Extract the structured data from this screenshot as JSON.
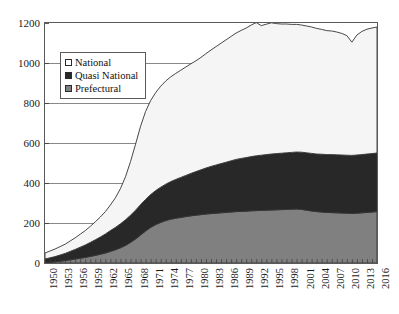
{
  "chart_data": {
    "type": "area",
    "stacked": true,
    "title": "",
    "subtitle": "",
    "xlabel": "",
    "ylabel": "",
    "grid": true,
    "legend_position": "top-left-inside",
    "xlim": [
      1950,
      2016
    ],
    "ylim": [
      0,
      1200
    ],
    "yticks": [
      0,
      200,
      400,
      600,
      800,
      1000,
      1200
    ],
    "xtick_step": 3,
    "xticks": [
      1950,
      1953,
      1956,
      1959,
      1962,
      1965,
      1968,
      1971,
      1974,
      1977,
      1980,
      1983,
      1986,
      1989,
      1992,
      1995,
      1998,
      2001,
      2004,
      2007,
      2010,
      2013,
      2016
    ],
    "x": [
      1950,
      1951,
      1952,
      1953,
      1954,
      1955,
      1956,
      1957,
      1958,
      1959,
      1960,
      1961,
      1962,
      1963,
      1964,
      1965,
      1966,
      1967,
      1968,
      1969,
      1970,
      1971,
      1972,
      1973,
      1974,
      1975,
      1976,
      1977,
      1978,
      1979,
      1980,
      1981,
      1982,
      1983,
      1984,
      1985,
      1986,
      1987,
      1988,
      1989,
      1990,
      1991,
      1992,
      1993,
      1994,
      1995,
      1996,
      1997,
      1998,
      1999,
      2000,
      2001,
      2002,
      2003,
      2004,
      2005,
      2006,
      2007,
      2008,
      2009,
      2010,
      2011,
      2012,
      2013,
      2014,
      2015,
      2016
    ],
    "series": [
      {
        "name": "Prefectural",
        "color": "#808080",
        "values": [
          2,
          4,
          6,
          9,
          12,
          16,
          20,
          24,
          28,
          33,
          38,
          44,
          50,
          58,
          66,
          76,
          88,
          103,
          120,
          140,
          160,
          178,
          192,
          203,
          212,
          219,
          224,
          228,
          232,
          236,
          239,
          242,
          245,
          247,
          249,
          251,
          253,
          255,
          257,
          258,
          259,
          261,
          262,
          263,
          264,
          265,
          266,
          267,
          268,
          269,
          270,
          268,
          264,
          260,
          257,
          255,
          253,
          252,
          251,
          250,
          249,
          248,
          249,
          251,
          253,
          255,
          257
        ]
      },
      {
        "name": "Quasi National",
        "color": "#282828",
        "values": [
          18,
          22,
          26,
          31,
          36,
          42,
          48,
          55,
          62,
          70,
          78,
          86,
          95,
          104,
          112,
          120,
          128,
          136,
          144,
          152,
          158,
          164,
          170,
          176,
          182,
          188,
          194,
          200,
          206,
          212,
          218,
          224,
          230,
          236,
          241,
          246,
          251,
          256,
          261,
          265,
          268,
          271,
          274,
          276,
          278,
          280,
          281,
          282,
          283,
          284,
          285,
          286,
          287,
          288,
          288,
          289,
          289,
          290,
          290,
          290,
          290,
          290,
          291,
          291,
          292,
          292,
          293
        ]
      },
      {
        "name": "National",
        "color": "#f5f5f5",
        "values": [
          30,
          34,
          38,
          42,
          46,
          52,
          58,
          65,
          72,
          80,
          90,
          100,
          112,
          128,
          148,
          176,
          215,
          268,
          330,
          392,
          440,
          470,
          490,
          505,
          516,
          524,
          530,
          536,
          542,
          548,
          554,
          562,
          572,
          582,
          592,
          602,
          612,
          622,
          632,
          640,
          648,
          658,
          666,
          648,
          652,
          656,
          650,
          646,
          644,
          640,
          638,
          636,
          634,
          632,
          628,
          624,
          620,
          618,
          614,
          608,
          598,
          566,
          600,
          616,
          624,
          628,
          630
        ]
      }
    ],
    "totals_note": "stacked totals peak just above 1000 around 1991-1992"
  },
  "legend": {
    "items": [
      {
        "label": "National",
        "swatch": "#ffffff"
      },
      {
        "label": "Quasi National",
        "swatch": "#282828"
      },
      {
        "label": "Prefectural",
        "swatch": "#808080"
      }
    ]
  },
  "axes": {
    "y_tick_labels": [
      "1200",
      "1000",
      "800",
      "600",
      "400",
      "200",
      "0"
    ],
    "x_tick_labels": [
      "1950",
      "1953",
      "1956",
      "1959",
      "1962",
      "1965",
      "1968",
      "1971",
      "1974",
      "1977",
      "1980",
      "1983",
      "1986",
      "1989",
      "1992",
      "1995",
      "1998",
      "2001",
      "2004",
      "2007",
      "2010",
      "2013",
      "2016"
    ]
  },
  "colors": {
    "frame": "#5a5a5a",
    "gridline": "#6a6a6a",
    "outline": "#333333",
    "national": "#f5f5f5",
    "quasi_national": "#282828",
    "prefectural": "#808080",
    "text": "#1a1a1a",
    "background": "#ffffff"
  }
}
